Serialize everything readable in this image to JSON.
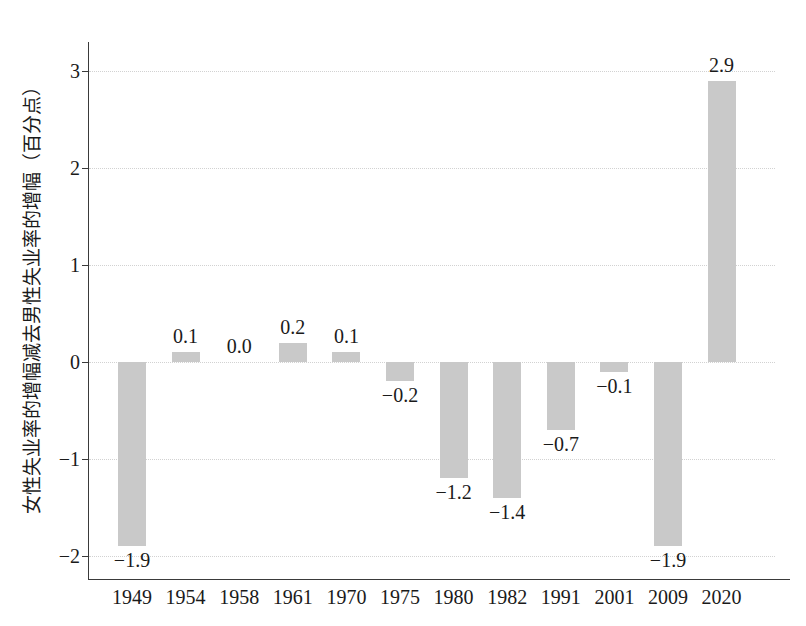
{
  "chart_data": {
    "type": "bar",
    "title": "",
    "subtitle": "",
    "xlabel": "",
    "ylabel": "女性失业率的增幅减去男性失业率的增幅（百分点）",
    "categories": [
      "1949",
      "1954",
      "1958",
      "1961",
      "1970",
      "1975",
      "1980",
      "1982",
      "1991",
      "2001",
      "2009",
      "2020"
    ],
    "values": [
      -1.9,
      0.1,
      0.0,
      0.2,
      0.1,
      -0.2,
      -1.2,
      -1.4,
      -0.7,
      -0.1,
      -1.9,
      2.9
    ],
    "value_labels": [
      "−1.9",
      "0.1",
      "0.0",
      "0.2",
      "0.1",
      "−0.2",
      "−1.2",
      "−1.4",
      "−0.7",
      "−0.1",
      "−1.9",
      "2.9"
    ],
    "ylim": [
      -2.25,
      3.3
    ],
    "yticks": [
      3,
      2,
      1,
      0,
      -1,
      -2
    ],
    "ytick_labels": [
      "3",
      "2",
      "1",
      "0",
      "−1",
      "−2"
    ],
    "grid": true,
    "grid_axis": "y",
    "legend": null,
    "series_color": "#c9c9c9",
    "axis_color": "#3a3a3a",
    "grid_color": "#d2d2d2",
    "text_color": "#1a1a1a",
    "background": "#ffffff"
  }
}
